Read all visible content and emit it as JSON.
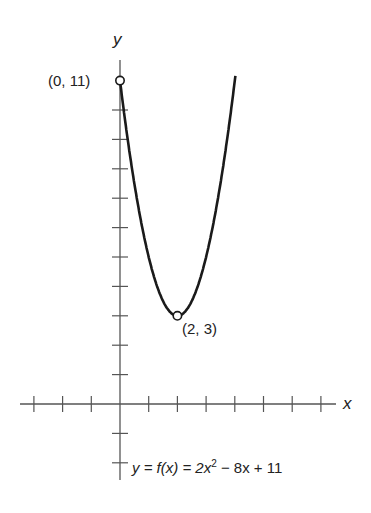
{
  "chart_data": {
    "type": "line",
    "title": "",
    "xlabel": "x",
    "ylabel": "y",
    "equation": "y = f(x) = 2x² − 8x + 11",
    "equation_parts": {
      "lhs": "y = f(x) = 2x",
      "exp": "2",
      "rhs": " − 8x + 11"
    },
    "xlim": [
      -3,
      7.5
    ],
    "ylim": [
      -2.6,
      11.5
    ],
    "x_ticks": [
      -3,
      -2,
      -1,
      1,
      2,
      3,
      4,
      5,
      6,
      7
    ],
    "y_ticks": [
      -2,
      -1,
      1,
      2,
      3,
      4,
      5,
      6,
      7,
      8,
      9,
      10
    ],
    "grid": false,
    "series": [
      {
        "name": "f(x) = 2x^2 - 8x + 11",
        "x": [
          0,
          0.5,
          1,
          1.5,
          2,
          2.5,
          3,
          3.5,
          4
        ],
        "y": [
          11,
          7.5,
          5,
          3.5,
          3,
          3.5,
          5,
          7.5,
          11
        ]
      }
    ],
    "annotations": [
      {
        "label": "(0, 11)",
        "x": 0,
        "y": 11,
        "marker": "open-circle"
      },
      {
        "label": "(2, 3)",
        "x": 2,
        "y": 3,
        "marker": "open-circle"
      }
    ]
  }
}
